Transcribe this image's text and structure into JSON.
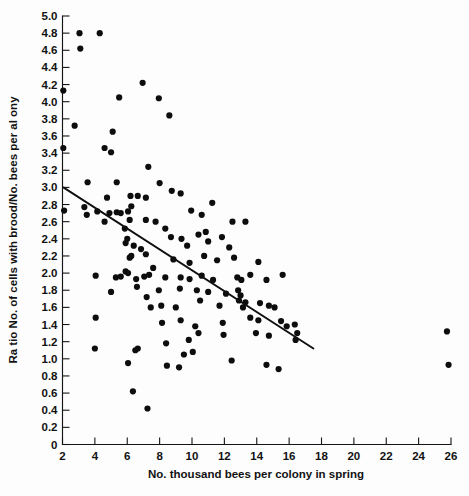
{
  "chart_data": {
    "type": "scatter",
    "title": "",
    "xlabel": "No. thousand bees per colony in spring",
    "ylabel": "Ra tio No. of cells with brood/No. bees per al ony",
    "xlim": [
      2,
      26
    ],
    "ylim": [
      0,
      5.0
    ],
    "grid": false,
    "legend": null,
    "xticks": [
      2,
      4,
      6,
      8,
      10,
      12,
      14,
      16,
      18,
      20,
      22,
      24,
      26
    ],
    "xtick_labels": [
      "2",
      "4",
      "6",
      "8",
      "10",
      "12",
      "14",
      "16",
      "18",
      "20",
      "22",
      "24",
      "26"
    ],
    "yticks": [
      0,
      0.2,
      0.4,
      0.6,
      0.8,
      1.0,
      1.2,
      1.4,
      1.6,
      1.8,
      2.0,
      2.2,
      2.4,
      2.6,
      2.8,
      3.0,
      3.2,
      3.4,
      3.6,
      3.8,
      4.0,
      4.2,
      4.4,
      4.6,
      4.8,
      5.0
    ],
    "ytick_labels": [
      "0",
      "0.2",
      "0.4",
      "0.6",
      "0.8",
      "1.0",
      "1.2",
      "1.4",
      "1.6",
      "1.8",
      "2.0",
      "2.2",
      "2.4",
      "2.6",
      "2.8",
      "3.0",
      "3.2",
      "3.4",
      "3.6",
      "3.8",
      "4.0",
      "4.2",
      "4.4",
      "4.6",
      "4.8",
      "5.0"
    ],
    "marker": "filled-circle",
    "marker_color": "#0d0d0d",
    "marker_size": 3.1,
    "trendline": {
      "type": "linear-regression",
      "color": "#101010",
      "x_start": 2.05,
      "y_start": 3.0,
      "x_end": 17.5,
      "y_end": 1.12
    },
    "points": [
      [
        3.05,
        4.8
      ],
      [
        4.3,
        4.8
      ],
      [
        3.1,
        4.62
      ],
      [
        2.05,
        4.13
      ],
      [
        5.5,
        4.05
      ],
      [
        7.95,
        4.04
      ],
      [
        6.95,
        4.22
      ],
      [
        2.75,
        3.72
      ],
      [
        5.1,
        3.65
      ],
      [
        4.6,
        3.46
      ],
      [
        5.0,
        3.41
      ],
      [
        7.3,
        3.24
      ],
      [
        2.05,
        3.46
      ],
      [
        8.6,
        3.84
      ],
      [
        3.55,
        3.06
      ],
      [
        5.35,
        3.06
      ],
      [
        8.0,
        3.05
      ],
      [
        2.1,
        2.73
      ],
      [
        3.35,
        2.77
      ],
      [
        3.5,
        2.68
      ],
      [
        4.75,
        2.88
      ],
      [
        6.2,
        2.9
      ],
      [
        6.65,
        2.9
      ],
      [
        7.15,
        2.88
      ],
      [
        8.75,
        2.96
      ],
      [
        4.15,
        2.72
      ],
      [
        4.9,
        2.7
      ],
      [
        5.35,
        2.71
      ],
      [
        5.6,
        2.7
      ],
      [
        6.05,
        2.72
      ],
      [
        6.15,
        2.62
      ],
      [
        6.25,
        2.78
      ],
      [
        7.15,
        2.62
      ],
      [
        7.75,
        2.6
      ],
      [
        9.3,
        2.93
      ],
      [
        9.95,
        2.73
      ],
      [
        10.6,
        2.68
      ],
      [
        11.25,
        2.82
      ],
      [
        4.6,
        2.6
      ],
      [
        5.85,
        2.52
      ],
      [
        6.0,
        2.4
      ],
      [
        5.9,
        2.35
      ],
      [
        6.4,
        2.32
      ],
      [
        6.85,
        2.28
      ],
      [
        8.7,
        2.42
      ],
      [
        9.35,
        2.4
      ],
      [
        9.7,
        2.32
      ],
      [
        10.4,
        2.45
      ],
      [
        11.0,
        2.37
      ],
      [
        11.85,
        2.42
      ],
      [
        12.3,
        2.3
      ],
      [
        6.15,
        2.18
      ],
      [
        6.25,
        2.2
      ],
      [
        7.15,
        2.22
      ],
      [
        8.85,
        2.16
      ],
      [
        9.85,
        2.12
      ],
      [
        10.75,
        2.2
      ],
      [
        11.55,
        2.15
      ],
      [
        12.6,
        2.18
      ],
      [
        14.1,
        2.13
      ],
      [
        4.05,
        1.97
      ],
      [
        5.3,
        1.95
      ],
      [
        5.6,
        1.96
      ],
      [
        5.9,
        2.02
      ],
      [
        6.05,
        2.0
      ],
      [
        6.55,
        1.93
      ],
      [
        7.05,
        1.96
      ],
      [
        7.35,
        1.98
      ],
      [
        8.35,
        1.95
      ],
      [
        9.3,
        1.95
      ],
      [
        9.85,
        1.93
      ],
      [
        10.6,
        1.97
      ],
      [
        11.3,
        1.92
      ],
      [
        12.8,
        1.95
      ],
      [
        13.05,
        1.92
      ],
      [
        6.6,
        1.84
      ],
      [
        7.95,
        1.8
      ],
      [
        9.25,
        1.82
      ],
      [
        10.3,
        1.8
      ],
      [
        11.0,
        1.78
      ],
      [
        12.1,
        1.76
      ],
      [
        12.85,
        1.8
      ],
      [
        13.0,
        1.74
      ],
      [
        4.05,
        1.48
      ],
      [
        7.45,
        1.6
      ],
      [
        8.1,
        1.62
      ],
      [
        9.0,
        1.6
      ],
      [
        10.5,
        1.68
      ],
      [
        11.7,
        1.62
      ],
      [
        12.9,
        1.68
      ],
      [
        13.15,
        1.6
      ],
      [
        13.3,
        1.66
      ],
      [
        14.2,
        1.65
      ],
      [
        14.75,
        1.62
      ],
      [
        15.1,
        1.6
      ],
      [
        8.15,
        1.42
      ],
      [
        9.3,
        1.45
      ],
      [
        10.2,
        1.38
      ],
      [
        11.9,
        1.42
      ],
      [
        13.6,
        1.48
      ],
      [
        14.1,
        1.45
      ],
      [
        15.5,
        1.44
      ],
      [
        16.35,
        1.4
      ],
      [
        4.0,
        1.12
      ],
      [
        6.5,
        1.1
      ],
      [
        6.65,
        1.12
      ],
      [
        8.4,
        1.18
      ],
      [
        9.8,
        1.22
      ],
      [
        10.4,
        1.3
      ],
      [
        11.95,
        1.28
      ],
      [
        13.95,
        1.3
      ],
      [
        15.85,
        1.38
      ],
      [
        16.5,
        1.3
      ],
      [
        14.75,
        1.27
      ],
      [
        16.4,
        1.22
      ],
      [
        9.5,
        1.05
      ],
      [
        10.05,
        1.08
      ],
      [
        6.05,
        0.95
      ],
      [
        8.45,
        0.92
      ],
      [
        9.2,
        0.9
      ],
      [
        12.45,
        0.98
      ],
      [
        14.6,
        0.93
      ],
      [
        15.35,
        0.88
      ],
      [
        6.35,
        0.62
      ],
      [
        7.25,
        0.42
      ],
      [
        25.75,
        1.32
      ],
      [
        25.85,
        0.93
      ],
      [
        12.5,
        2.6
      ],
      [
        13.3,
        2.6
      ],
      [
        10.85,
        2.48
      ],
      [
        8.35,
        2.52
      ],
      [
        7.6,
        2.06
      ],
      [
        13.6,
        1.98
      ],
      [
        14.6,
        1.92
      ],
      [
        15.6,
        1.98
      ],
      [
        7.2,
        1.72
      ],
      [
        5.0,
        1.78
      ]
    ]
  }
}
